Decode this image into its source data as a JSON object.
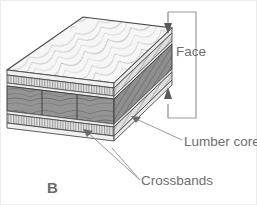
{
  "figure": {
    "panel_letter": "B",
    "title_caption": "",
    "type": "isometric cutaway of lumber-core plywood panel"
  },
  "labels": {
    "face": "Face",
    "lumber_core": "Lumber core",
    "crossbands": "Crossbands",
    "panel_letter": "B"
  },
  "colors": {
    "background": "#ffffff",
    "outline": "#3a3a3a",
    "text": "#6e6e6e",
    "leader": "#8a8a8a",
    "face_veneer_light": "#f2f2f2",
    "crossband_hatch": "#d8d8d8",
    "lumber_core_dark": "#8e8e8e",
    "side_shadow": "#9a9a9a",
    "thin_glue_line": "#e6e6e6",
    "border": "#e8e8e8"
  },
  "layers": [
    {
      "name": "face",
      "label": "Face",
      "position": "top",
      "shading": "wood grain, light"
    },
    {
      "name": "crossband-upper",
      "label": "Crossbands",
      "position": "under face",
      "shading": "vertical hatch"
    },
    {
      "name": "lumber-core",
      "label": "Lumber core",
      "position": "center",
      "shading": "dark wood grain, 3 boards"
    },
    {
      "name": "crossband-lower",
      "label": "Crossbands",
      "position": "above back face",
      "shading": "vertical hatch"
    },
    {
      "name": "back-face",
      "label": "Face",
      "position": "bottom",
      "shading": "wood grain, light"
    }
  ],
  "annotations": {
    "face_bracket": {
      "text": "Face",
      "style": "square bracket with arrowheads at both ends",
      "arrow_top": "down",
      "arrow_bottom": "up"
    },
    "lumber_core_leader": {
      "text": "Lumber core",
      "style": "single leader line to core layer"
    },
    "crossbands_leader": {
      "text": "Crossbands",
      "style": "two leader lines branching to upper and lower crossbands"
    }
  }
}
